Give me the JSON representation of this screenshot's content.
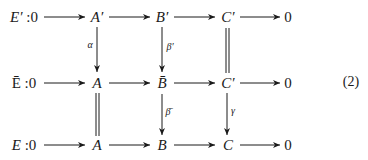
{
  "diagram": {
    "equation_number": "(2)",
    "rows": [
      {
        "label": "E′ :0",
        "nodes": [
          "A′",
          "B′",
          "C′",
          "0"
        ]
      },
      {
        "label": "Ē :0",
        "nodes": [
          "A",
          "B̄",
          "C′",
          "0"
        ]
      },
      {
        "label": "E :0",
        "nodes": [
          "A",
          "B",
          "C",
          "0"
        ]
      }
    ],
    "vertical_maps": {
      "alpha": "α",
      "beta_prime": "β′",
      "beta_bar": "β̄",
      "gamma": "γ"
    }
  }
}
